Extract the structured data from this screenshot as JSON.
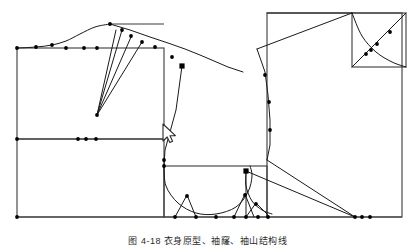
{
  "figure": {
    "title": "",
    "caption": "图 4-18  衣身原型、袖窿、袖山结构线",
    "background_color": "#ffffff",
    "line_color": "#3a3a3a",
    "accent_line_color": "#1a1a1a",
    "node_color": "#000000",
    "canvas_width": 416,
    "canvas_height": 250
  },
  "cursor": {
    "name": "mouse-pointer",
    "x": 163,
    "y": 124,
    "color": "#2a2a2a"
  },
  "chart_data": {
    "type": "diagram",
    "xlabel": "",
    "ylabel": "",
    "xlim": [
      0,
      416
    ],
    "ylim": [
      250,
      0
    ],
    "grid": false,
    "legend": null,
    "annotations": [],
    "shapes": [
      {
        "name": "bodice-front-block-rect",
        "type": "rect",
        "x": 17,
        "y": 48,
        "w": 147,
        "h": 91
      },
      {
        "name": "bodice-front-lower-rect",
        "type": "rect",
        "x": 17,
        "y": 139,
        "w": 147,
        "h": 78
      },
      {
        "name": "armhole-box-rect",
        "type": "rect",
        "x": 164,
        "y": 166,
        "w": 103,
        "h": 51
      },
      {
        "name": "back-block-rect",
        "type": "rect",
        "x": 267,
        "y": 13,
        "w": 135,
        "h": 204
      },
      {
        "name": "sleeve-cap-square",
        "type": "rect",
        "x": 352,
        "y": 13,
        "w": 54,
        "h": 54
      },
      {
        "name": "shoulder-guide-line",
        "type": "line",
        "points": [
          [
            110,
            24
          ],
          [
            164,
            24
          ]
        ]
      },
      {
        "name": "baseline-bottom",
        "type": "line",
        "points": [
          [
            17,
            217
          ],
          [
            402,
            217
          ]
        ]
      }
    ],
    "polylines": [
      {
        "name": "front-neck-shoulder-curve",
        "points": [
          [
            17,
            48
          ],
          [
            36,
            47
          ],
          [
            52,
            45
          ],
          [
            66,
            41
          ],
          [
            80,
            34
          ],
          [
            95,
            27
          ],
          [
            110,
            24
          ]
        ],
        "curved": true
      },
      {
        "name": "shoulder-slope-upper",
        "points": [
          [
            110,
            24
          ],
          [
            130,
            30
          ],
          [
            150,
            37
          ],
          [
            168,
            43
          ],
          [
            185,
            49
          ],
          [
            200,
            55
          ],
          [
            214,
            61
          ],
          [
            228,
            67
          ],
          [
            243,
            72
          ]
        ],
        "curved": false
      },
      {
        "name": "dart-leg-a",
        "points": [
          [
            97,
            115
          ],
          [
            116,
            30
          ]
        ]
      },
      {
        "name": "dart-leg-b",
        "points": [
          [
            97,
            115
          ],
          [
            122,
            30
          ]
        ]
      },
      {
        "name": "dart-leg-c",
        "points": [
          [
            97,
            115
          ],
          [
            131,
            37
          ]
        ]
      },
      {
        "name": "dart-leg-d",
        "points": [
          [
            97,
            115
          ],
          [
            142,
            42
          ]
        ]
      },
      {
        "name": "front-side-seam",
        "points": [
          [
            182,
            66
          ],
          [
            176,
            110
          ],
          [
            170,
            132
          ],
          [
            165,
            150
          ],
          [
            164,
            166
          ]
        ]
      },
      {
        "name": "back-shoulder-slope",
        "points": [
          [
            267,
            13
          ],
          [
            352,
            13
          ]
        ]
      },
      {
        "name": "back-shoulder-diagonal",
        "points": [
          [
            257,
            49
          ],
          [
            352,
            13
          ]
        ]
      },
      {
        "name": "back-side-upper",
        "points": [
          [
            257,
            49
          ],
          [
            265,
            72
          ],
          [
            268,
            95
          ],
          [
            270,
            120
          ],
          [
            270,
            145
          ],
          [
            267,
            160
          ]
        ]
      },
      {
        "name": "back-underarm-diagonal-1",
        "points": [
          [
            267,
            160
          ],
          [
            355,
            217
          ]
        ]
      },
      {
        "name": "back-underarm-diagonal-2",
        "points": [
          [
            246,
            171
          ],
          [
            355,
            217
          ]
        ]
      },
      {
        "name": "sleeve-cap-rising-diagonal",
        "points": [
          [
            352,
            67
          ],
          [
            406,
            13
          ]
        ]
      },
      {
        "name": "sleeve-cap-falling-curve",
        "points": [
          [
            352,
            13
          ],
          [
            362,
            36
          ],
          [
            376,
            52
          ],
          [
            392,
            62
          ],
          [
            406,
            67
          ]
        ],
        "curved": true
      },
      {
        "name": "armhole-main-curve",
        "points": [
          [
            164,
            166
          ],
          [
            166,
            186
          ],
          [
            178,
            203
          ],
          [
            196,
            213
          ],
          [
            216,
            214
          ],
          [
            236,
            207
          ],
          [
            248,
            192
          ],
          [
            252,
            176
          ],
          [
            250,
            166
          ]
        ],
        "curved": true
      },
      {
        "name": "armhole-notch-left",
        "points": [
          [
            175,
            217
          ],
          [
            187,
            195
          ],
          [
            196,
            217
          ]
        ]
      },
      {
        "name": "armhole-notch-right",
        "points": [
          [
            234,
            217
          ],
          [
            245,
            194
          ],
          [
            254,
            217
          ]
        ]
      },
      {
        "name": "front-armhole-small-curve",
        "points": [
          [
            246,
            171
          ],
          [
            246,
            186
          ],
          [
            252,
            201
          ],
          [
            262,
            210
          ],
          [
            272,
            214
          ]
        ],
        "curved": true
      },
      {
        "name": "front-armhole-notch",
        "points": [
          [
            246,
            217
          ],
          [
            256,
            203
          ],
          [
            268,
            215
          ]
        ]
      },
      {
        "name": "armhole-vertical-right",
        "points": [
          [
            246,
            171
          ],
          [
            246,
            217
          ]
        ]
      }
    ],
    "nodes": [
      {
        "name": "node",
        "x": 17,
        "y": 48,
        "shape": "dot"
      },
      {
        "name": "node",
        "x": 36,
        "y": 47,
        "shape": "dot"
      },
      {
        "name": "node",
        "x": 52,
        "y": 45,
        "shape": "dot"
      },
      {
        "name": "node",
        "x": 66,
        "y": 48,
        "shape": "dot"
      },
      {
        "name": "node",
        "x": 84,
        "y": 48,
        "shape": "dot"
      },
      {
        "name": "node",
        "x": 97,
        "y": 48,
        "shape": "dot"
      },
      {
        "name": "node",
        "x": 110,
        "y": 24,
        "shape": "dot"
      },
      {
        "name": "node",
        "x": 122,
        "y": 30,
        "shape": "dot"
      },
      {
        "name": "node",
        "x": 131,
        "y": 36,
        "shape": "dot"
      },
      {
        "name": "node",
        "x": 142,
        "y": 42,
        "shape": "dot"
      },
      {
        "name": "node",
        "x": 155,
        "y": 47,
        "shape": "dot"
      },
      {
        "name": "node",
        "x": 172,
        "y": 57,
        "shape": "dot"
      },
      {
        "name": "node",
        "x": 182,
        "y": 66,
        "shape": "square"
      },
      {
        "name": "node",
        "x": 97,
        "y": 115,
        "shape": "dot"
      },
      {
        "name": "node",
        "x": 17,
        "y": 139,
        "shape": "dot"
      },
      {
        "name": "node",
        "x": 78,
        "y": 139,
        "shape": "dot"
      },
      {
        "name": "node",
        "x": 86,
        "y": 139,
        "shape": "dot"
      },
      {
        "name": "node",
        "x": 96,
        "y": 139,
        "shape": "dot"
      },
      {
        "name": "node",
        "x": 17,
        "y": 217,
        "shape": "dot"
      },
      {
        "name": "node",
        "x": 164,
        "y": 160,
        "shape": "dot"
      },
      {
        "name": "node",
        "x": 164,
        "y": 166,
        "shape": "dot"
      },
      {
        "name": "node",
        "x": 175,
        "y": 217,
        "shape": "dot"
      },
      {
        "name": "node",
        "x": 187,
        "y": 196,
        "shape": "dot"
      },
      {
        "name": "node",
        "x": 196,
        "y": 217,
        "shape": "dot"
      },
      {
        "name": "node",
        "x": 216,
        "y": 217,
        "shape": "dot"
      },
      {
        "name": "node",
        "x": 234,
        "y": 217,
        "shape": "dot"
      },
      {
        "name": "node",
        "x": 245,
        "y": 195,
        "shape": "dot"
      },
      {
        "name": "node",
        "x": 246,
        "y": 171,
        "shape": "square"
      },
      {
        "name": "node",
        "x": 256,
        "y": 204,
        "shape": "dot"
      },
      {
        "name": "node",
        "x": 246,
        "y": 217,
        "shape": "dot"
      },
      {
        "name": "node",
        "x": 258,
        "y": 217,
        "shape": "dot"
      },
      {
        "name": "node",
        "x": 268,
        "y": 217,
        "shape": "dot"
      },
      {
        "name": "node",
        "x": 265,
        "y": 75,
        "shape": "dot"
      },
      {
        "name": "node",
        "x": 269,
        "y": 102,
        "shape": "dot"
      },
      {
        "name": "node",
        "x": 270,
        "y": 130,
        "shape": "dot"
      },
      {
        "name": "node",
        "x": 355,
        "y": 217,
        "shape": "dot"
      },
      {
        "name": "node",
        "x": 362,
        "y": 217,
        "shape": "dot"
      },
      {
        "name": "node",
        "x": 370,
        "y": 217,
        "shape": "dot"
      },
      {
        "name": "node",
        "x": 377,
        "y": 44,
        "shape": "dot"
      },
      {
        "name": "node",
        "x": 371,
        "y": 50,
        "shape": "dot"
      },
      {
        "name": "node",
        "x": 366,
        "y": 54,
        "shape": "dot"
      },
      {
        "name": "node",
        "x": 390,
        "y": 32,
        "shape": "dot"
      }
    ]
  }
}
